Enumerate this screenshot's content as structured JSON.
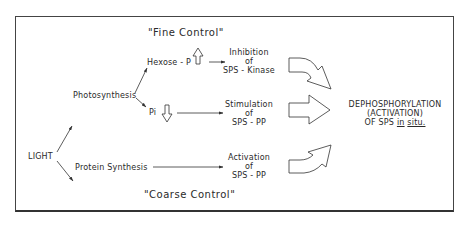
{
  "diagram": {
    "title_top": "\"Fine Control\"",
    "title_bottom": "\"Coarse Control\"",
    "source": {
      "label": "LIGHT"
    },
    "branches": [
      {
        "label": "Photosynthesis"
      },
      {
        "label": "Protein Synthesis"
      }
    ],
    "metabolites": [
      {
        "label": "Hexose - P",
        "direction": "up"
      },
      {
        "label": "Pi",
        "direction": "down"
      }
    ],
    "effects": [
      {
        "line1": "Inhibition",
        "line2": "of",
        "line3": "SPS - Kinase"
      },
      {
        "line1": "Stimulation",
        "line2": "of",
        "line3": "SPS - PP"
      },
      {
        "line1": "Activation",
        "line2": "of",
        "line3": "SPS - PP"
      }
    ],
    "outcome": {
      "line1": "DEPHOSPHORYLATION",
      "line2": "(ACTIVATION)",
      "line3_prefix": "OF SPS ",
      "line3_in": "in",
      "line3_situ": "situ."
    }
  }
}
